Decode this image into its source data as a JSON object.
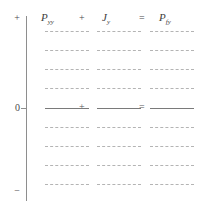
{
  "figure": {
    "title": "",
    "axis": {
      "top_label": "+",
      "zero_label": "0",
      "bottom_label": "−"
    },
    "operators": {
      "plus": "+",
      "equals": "="
    },
    "columns": [
      {
        "symbol": "P",
        "subscript": "yy",
        "left_px": 41,
        "line_left_px": 45,
        "line_width_px": 44
      },
      {
        "symbol": "J",
        "subscript": "y",
        "left_px": 102,
        "line_left_px": 97,
        "line_width_px": 44
      },
      {
        "symbol": "P",
        "subscript": "fy",
        "line_left_px": 150,
        "line_width_px": 44,
        "left_px": 159
      }
    ],
    "rows": [
      {
        "kind": "dashed",
        "top_px": 31
      },
      {
        "kind": "dashed",
        "top_px": 50
      },
      {
        "kind": "dashed",
        "top_px": 69
      },
      {
        "kind": "dashed",
        "top_px": 88
      },
      {
        "kind": "solid",
        "top_px": 108
      },
      {
        "kind": "dashed",
        "top_px": 127
      },
      {
        "kind": "dashed",
        "top_px": 146
      },
      {
        "kind": "dashed",
        "top_px": 165
      },
      {
        "kind": "dashed",
        "top_px": 184
      }
    ],
    "colors": {
      "axis": "#8e8e8e",
      "solid_line": "#7a7a7a",
      "dashed_line": "#b4b4b4",
      "text": "#4a4a4a",
      "background": "#ffffff"
    }
  }
}
